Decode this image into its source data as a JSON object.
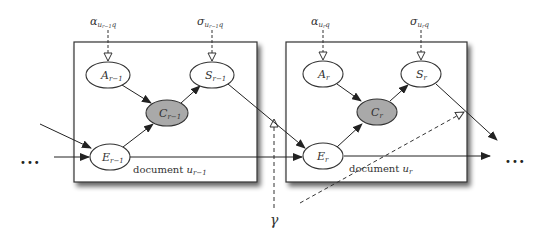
{
  "diagram": {
    "type": "graphical-model",
    "plates": [
      {
        "id": "plate-prev",
        "label": "document",
        "label_var": "u",
        "label_sub": "r−1"
      },
      {
        "id": "plate-curr",
        "label": "document",
        "label_var": "u",
        "label_sub": "r"
      }
    ],
    "nodes": {
      "A_prev": {
        "var": "A",
        "sub": "r−1",
        "observed": false
      },
      "S_prev": {
        "var": "S",
        "sub": "r−1",
        "observed": false
      },
      "C_prev": {
        "var": "C",
        "sub": "r−1",
        "observed": true
      },
      "E_prev": {
        "var": "E",
        "sub": "r−1",
        "observed": false
      },
      "A_curr": {
        "var": "A",
        "sub": "r",
        "observed": false
      },
      "S_curr": {
        "var": "S",
        "sub": "r",
        "observed": false
      },
      "C_curr": {
        "var": "C",
        "sub": "r",
        "observed": true
      },
      "E_curr": {
        "var": "E",
        "sub": "r",
        "observed": false
      }
    },
    "params": {
      "alpha_prev": {
        "sym": "α",
        "sub": "u",
        "subsub": "r−1",
        "tail": "q"
      },
      "sigma_prev": {
        "sym": "σ",
        "sub": "u",
        "subsub": "r−1",
        "tail": "q"
      },
      "alpha_curr": {
        "sym": "α",
        "sub": "u",
        "subsub": "r",
        "tail": "q"
      },
      "sigma_curr": {
        "sym": "σ",
        "sub": "u",
        "subsub": "r",
        "tail": "q"
      },
      "gamma": {
        "sym": "γ"
      }
    },
    "ellipsis_left": "•••",
    "ellipsis_right": "•••",
    "edges": [
      [
        "A_prev",
        "C_prev"
      ],
      [
        "E_prev",
        "C_prev"
      ],
      [
        "C_prev",
        "S_prev"
      ],
      [
        "S_prev",
        "E_curr"
      ],
      [
        "E_prev",
        "E_curr"
      ],
      [
        "A_curr",
        "C_curr"
      ],
      [
        "E_curr",
        "C_curr"
      ],
      [
        "C_curr",
        "S_curr"
      ]
    ],
    "colors": {
      "stroke": "#333333",
      "observed_fill": "#a9a9a9",
      "plate_shadow": "#555555"
    }
  }
}
